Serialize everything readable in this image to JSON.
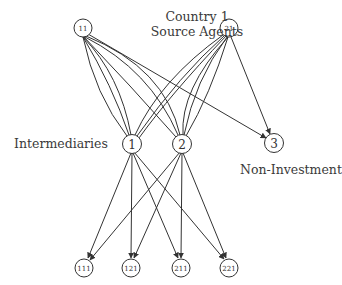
{
  "labels": {
    "title_line1": "Country 1",
    "title_line2": "Source Agents",
    "intermediaries": "Intermediaries",
    "non_investment": "Non-Investment"
  },
  "nodes": {
    "source_11": {
      "label": "11",
      "x": 83,
      "y": 28,
      "r": 9
    },
    "source_21": {
      "label": "21",
      "x": 229,
      "y": 28,
      "r": 9
    },
    "inter_1": {
      "label": "1",
      "x": 132,
      "y": 144,
      "r": 9.5
    },
    "inter_2": {
      "label": "2",
      "x": 182,
      "y": 144,
      "r": 9.5
    },
    "noninv_3": {
      "label": "3",
      "x": 274,
      "y": 143,
      "r": 9.5
    },
    "dest_111": {
      "label": "111",
      "x": 84,
      "y": 268,
      "r": 9
    },
    "dest_121": {
      "label": "121",
      "x": 131,
      "y": 268,
      "r": 9
    },
    "dest_211": {
      "label": "211",
      "x": 181,
      "y": 268,
      "r": 9
    },
    "dest_221": {
      "label": "221",
      "x": 229,
      "y": 268,
      "r": 9
    }
  },
  "edges": [
    {
      "from": "11",
      "to": "1",
      "multiplicity": 3
    },
    {
      "from": "11",
      "to": "2",
      "multiplicity": 3
    },
    {
      "from": "11",
      "to": "3",
      "multiplicity": 1,
      "arrow": true
    },
    {
      "from": "21",
      "to": "1",
      "multiplicity": 3
    },
    {
      "from": "21",
      "to": "2",
      "multiplicity": 3
    },
    {
      "from": "21",
      "to": "3",
      "multiplicity": 1,
      "arrow": true
    },
    {
      "from": "1",
      "to": "111",
      "arrow": true
    },
    {
      "from": "1",
      "to": "121",
      "arrow": true
    },
    {
      "from": "1",
      "to": "211",
      "arrow": true
    },
    {
      "from": "1",
      "to": "221",
      "arrow": true
    },
    {
      "from": "2",
      "to": "111",
      "arrow": true
    },
    {
      "from": "2",
      "to": "121",
      "arrow": true
    },
    {
      "from": "2",
      "to": "211",
      "arrow": true
    },
    {
      "from": "2",
      "to": "221",
      "arrow": true
    }
  ],
  "colors": {
    "stroke": "#333333",
    "text": "#3a3a3a",
    "background": "#ffffff"
  }
}
